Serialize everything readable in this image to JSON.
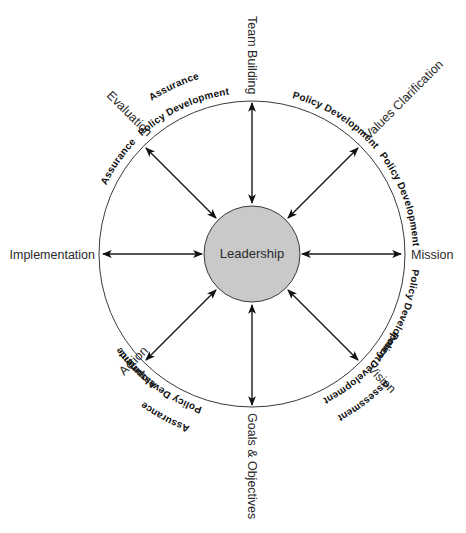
{
  "diagram": {
    "center": {
      "label": "Leadership",
      "fill": "#c9c9c9"
    },
    "nodes": [
      {
        "id": "team-building",
        "label": "Team Building"
      },
      {
        "id": "values-clarification",
        "label": "Values Clarification"
      },
      {
        "id": "mission",
        "label": "Mission"
      },
      {
        "id": "vision",
        "label": "Vision"
      },
      {
        "id": "goals-objectives",
        "label": "Goals & Objectives"
      },
      {
        "id": "action",
        "label": "Action"
      },
      {
        "id": "implementation",
        "label": "Implementation"
      },
      {
        "id": "evaluation",
        "label": "Evaluation"
      }
    ],
    "arcs": [
      {
        "between": "team-building / values-clarification",
        "labels": [
          "Policy Development"
        ]
      },
      {
        "between": "values-clarification / mission",
        "labels": [
          "Policy Development"
        ]
      },
      {
        "between": "mission / vision",
        "labels": [
          "Policy Development"
        ]
      },
      {
        "between": "vision / goals-objectives",
        "labels": [
          "Policy Development",
          "Assessment"
        ]
      },
      {
        "between": "goals-objectives / action",
        "labels": [
          "Policy Development",
          "Assurance"
        ]
      },
      {
        "between": "action / implementation",
        "labels": [
          "Assurance"
        ]
      },
      {
        "between": "implementation / evaluation",
        "labels": [
          "Assurance"
        ]
      },
      {
        "between": "evaluation / team-building",
        "labels": [
          "Policy Development",
          "Assurance"
        ]
      }
    ],
    "connector": "double-headed arrow"
  }
}
